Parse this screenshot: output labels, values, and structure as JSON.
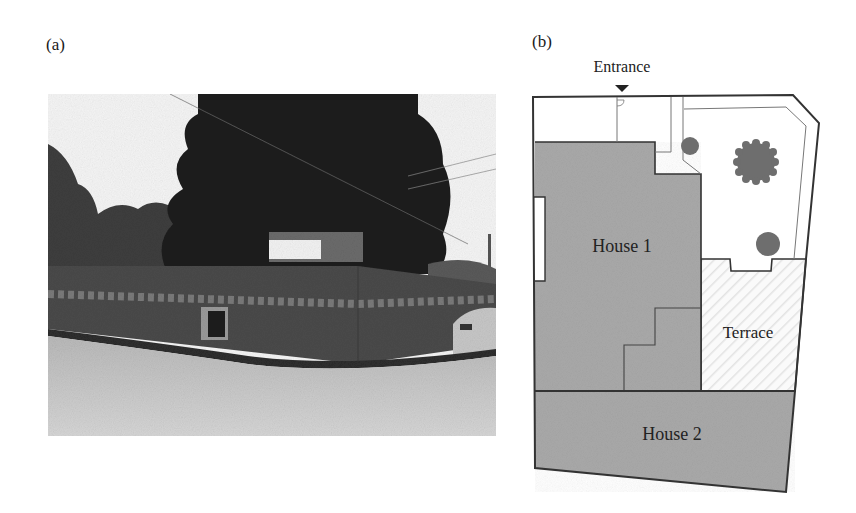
{
  "figure": {
    "panels": [
      {
        "id": "a",
        "label": "(a)",
        "type": "photograph",
        "description": "Grayscale street-level photo of a walled corner lot with a large dark tree behind a long painted wall, a small window/door opening in the wall, a white sign board above the wall, and a parked car at right edge"
      },
      {
        "id": "b",
        "label": "(b)",
        "type": "site-plan",
        "entrance_label": "Entrance",
        "entrance_marker": "triangle-down-icon",
        "areas": [
          {
            "name": "House 1",
            "fill": "#a9a9a9"
          },
          {
            "name": "Terrace",
            "fill": "#f7f7f7",
            "pattern": "diagonal-hatch"
          },
          {
            "name": "House 2",
            "fill": "#a9a9a9"
          }
        ],
        "trees": [
          {
            "size": "small",
            "position": "upper-left garden"
          },
          {
            "size": "large",
            "position": "upper-center garden"
          },
          {
            "size": "small",
            "position": "lower garden"
          }
        ],
        "colors": {
          "outline": "#3a3a3a",
          "thin_line": "#7a7a7a",
          "house_fill": "#a9a9a9",
          "tree_fill": "#6e6e6e",
          "background": "#ffffff"
        }
      }
    ]
  }
}
